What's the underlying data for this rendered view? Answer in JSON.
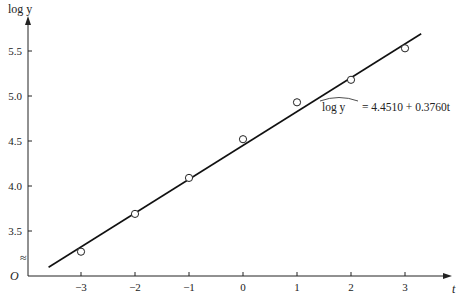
{
  "chart_data": {
    "type": "scatter",
    "title": "",
    "xlabel": "t",
    "ylabel": "log y",
    "x_ticks": [
      -3,
      -2,
      -1,
      0,
      1,
      2,
      3
    ],
    "x_tick_labels": [
      "−3",
      "−2",
      "−1",
      "0",
      "1",
      "2",
      "3"
    ],
    "y_ticks": [
      3.5,
      4.0,
      4.5,
      5.0,
      5.5
    ],
    "y_tick_labels": [
      "3.5",
      "4.0",
      "4.5",
      "5.0",
      "5.5"
    ],
    "origin_label": "O",
    "axis_break": "≈",
    "grid": false,
    "series": [
      {
        "name": "observed",
        "marker": "open-circle",
        "x": [
          -3,
          -2,
          -1,
          0,
          1,
          2,
          3
        ],
        "y": [
          3.27,
          3.69,
          4.09,
          4.52,
          4.93,
          5.18,
          5.53
        ]
      },
      {
        "name": "fitted line",
        "type": "line",
        "intercept": 4.451,
        "slope": 0.376,
        "x_range": [
          -3.6,
          3.3
        ]
      }
    ],
    "annotation": {
      "lhs": "log y",
      "rhs": "= 4.4510 + 0.3760t"
    }
  }
}
